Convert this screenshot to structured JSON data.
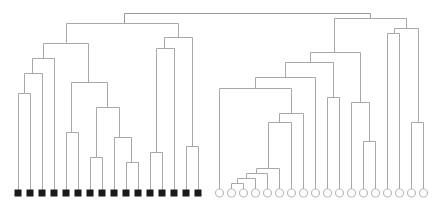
{
  "diagram": {
    "type": "dendrogram",
    "style": {
      "link_color": "#a8a8a8",
      "link_color_dark": "#9a9a9a",
      "left_marker_fill": "#1a1a1a",
      "right_marker_stroke": "#bdbdbd",
      "background": "#ffffff"
    },
    "leaf_y": 193,
    "left_leaves": {
      "marker": "filled-square",
      "count": 16,
      "x": [
        18,
        30,
        42,
        54,
        66,
        78,
        90,
        102,
        114,
        126,
        138,
        150,
        162,
        174,
        186,
        198
      ]
    },
    "right_leaves": {
      "marker": "hollow-circle",
      "count": 18,
      "x": [
        219,
        231,
        243,
        255,
        267,
        279,
        291,
        303,
        315,
        327,
        339,
        351,
        363,
        375,
        387,
        399,
        411,
        423
      ]
    },
    "links": [
      {
        "x1": 124,
        "x2": 370,
        "y": 13,
        "l_bottom": 23,
        "r_bottom": 18
      },
      {
        "x1": 66,
        "x2": 178,
        "y": 23,
        "l_bottom": 43,
        "r_bottom": 37
      },
      {
        "x1": 43,
        "x2": 88,
        "y": 43,
        "l_bottom": 58,
        "r_bottom": 82
      },
      {
        "x1": 32,
        "x2": 54,
        "y": 58,
        "l_bottom": 73,
        "r_bottom": 193
      },
      {
        "x1": 24,
        "x2": 42,
        "y": 73,
        "l_bottom": 93,
        "r_bottom": 193
      },
      {
        "x1": 18,
        "x2": 30,
        "y": 93,
        "l_bottom": 193,
        "r_bottom": 193
      },
      {
        "x1": 71,
        "x2": 107,
        "y": 82,
        "l_bottom": 132,
        "r_bottom": 107
      },
      {
        "x1": 66,
        "x2": 78,
        "y": 132,
        "l_bottom": 193,
        "r_bottom": 193
      },
      {
        "x1": 96,
        "x2": 119,
        "y": 107,
        "l_bottom": 157,
        "r_bottom": 137
      },
      {
        "x1": 90,
        "x2": 102,
        "y": 157,
        "l_bottom": 193,
        "r_bottom": 193
      },
      {
        "x1": 114,
        "x2": 131,
        "y": 137,
        "l_bottom": 193,
        "r_bottom": 162
      },
      {
        "x1": 126,
        "x2": 138,
        "y": 162,
        "l_bottom": 193,
        "r_bottom": 193
      },
      {
        "x1": 164,
        "x2": 192,
        "y": 37,
        "l_bottom": 48,
        "r_bottom": 146
      },
      {
        "x1": 156,
        "x2": 174,
        "y": 48,
        "l_bottom": 152,
        "r_bottom": 193
      },
      {
        "x1": 150,
        "x2": 162,
        "y": 152,
        "l_bottom": 193,
        "r_bottom": 193
      },
      {
        "x1": 186,
        "x2": 198,
        "y": 146,
        "l_bottom": 193,
        "r_bottom": 193
      },
      {
        "x1": 334,
        "x2": 406,
        "y": 18,
        "l_bottom": 52,
        "r_bottom": 28
      },
      {
        "x1": 310,
        "x2": 360,
        "y": 52,
        "l_bottom": 62,
        "r_bottom": 102
      },
      {
        "x1": 285,
        "x2": 333,
        "y": 62,
        "l_bottom": 77,
        "r_bottom": 97
      },
      {
        "x1": 255,
        "x2": 315,
        "y": 77,
        "l_bottom": 88,
        "r_bottom": 193
      },
      {
        "x1": 219,
        "x2": 291,
        "y": 88,
        "l_bottom": 193,
        "r_bottom": 113
      },
      {
        "x1": 279,
        "x2": 303,
        "y": 113,
        "l_bottom": 122,
        "r_bottom": 193
      },
      {
        "x1": 268,
        "x2": 291,
        "y": 122,
        "l_bottom": 168,
        "r_bottom": 193
      },
      {
        "x1": 256,
        "x2": 279,
        "y": 168,
        "l_bottom": 173,
        "r_bottom": 193
      },
      {
        "x1": 246,
        "x2": 267,
        "y": 173,
        "l_bottom": 178,
        "r_bottom": 193
      },
      {
        "x1": 237,
        "x2": 255,
        "y": 178,
        "l_bottom": 183,
        "r_bottom": 193
      },
      {
        "x1": 231,
        "x2": 243,
        "y": 183,
        "l_bottom": 193,
        "r_bottom": 193
      },
      {
        "x1": 327,
        "x2": 339,
        "y": 97,
        "l_bottom": 193,
        "r_bottom": 193
      },
      {
        "x1": 351,
        "x2": 369,
        "y": 102,
        "l_bottom": 193,
        "r_bottom": 141
      },
      {
        "x1": 363,
        "x2": 375,
        "y": 141,
        "l_bottom": 193,
        "r_bottom": 193
      },
      {
        "x1": 394,
        "x2": 418,
        "y": 28,
        "l_bottom": 33,
        "r_bottom": 122
      },
      {
        "x1": 387,
        "x2": 399,
        "y": 33,
        "l_bottom": 193,
        "r_bottom": 193
      },
      {
        "x1": 411,
        "x2": 423,
        "y": 122,
        "l_bottom": 193,
        "r_bottom": 193
      }
    ]
  }
}
